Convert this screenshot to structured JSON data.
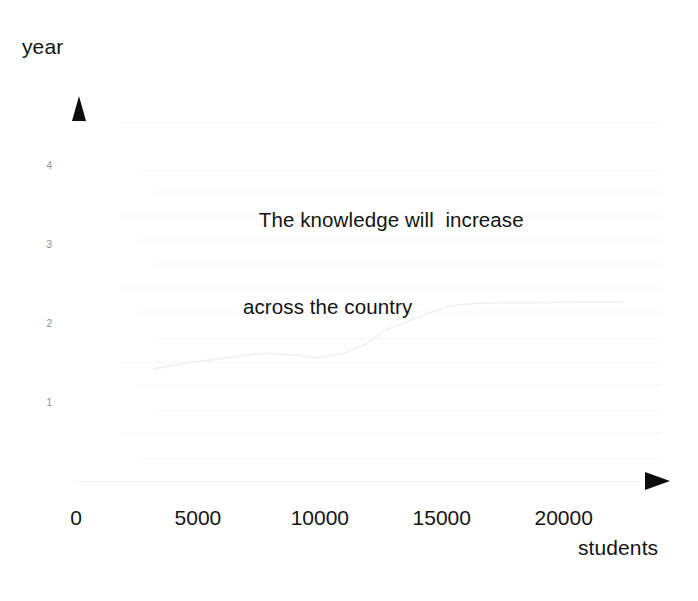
{
  "chart_data": {
    "type": "line",
    "title": "",
    "annotation": "The knowledge will  increase\nacross the country",
    "annotation_lines": [
      "The knowledge will  increase",
      "across the country"
    ],
    "xlabel": "students",
    "ylabel": "year",
    "x_tick_labels": [
      "0",
      "5000",
      "10000",
      "15000",
      "20000"
    ],
    "x_tick_values": [
      0,
      5000,
      10000,
      15000,
      20000
    ],
    "y_tick_labels": [
      "1",
      "2",
      "3",
      "4"
    ],
    "y_tick_values": [
      1,
      2,
      3,
      4
    ],
    "xlim": [
      0,
      23500
    ],
    "ylim": [
      0,
      4.6
    ],
    "grid": true,
    "grid_orientation": "horizontal",
    "legend": "none",
    "series": [
      {
        "name": "knowledge",
        "x": [
          3200,
          4600,
          6200,
          7600,
          8900,
          9900,
          11000,
          11900,
          12600,
          13600,
          14600,
          15400,
          16400,
          17600,
          19000,
          20600,
          22400
        ],
        "values": [
          1.42,
          1.5,
          1.56,
          1.62,
          1.6,
          1.56,
          1.62,
          1.74,
          1.9,
          2.02,
          2.14,
          2.22,
          2.25,
          2.26,
          2.26,
          2.27,
          2.27
        ]
      }
    ],
    "colors": {
      "axis": "#f2f2f4",
      "arrow": "#0d0d0d",
      "gridline": "#f4f4f6",
      "series": "#f0f0f3",
      "text": "#141414",
      "y_tick_text": "#8d8d92",
      "background": "#ffffff"
    },
    "faint_gridline_y_px": [
      122,
      170,
      192,
      216,
      240,
      264,
      288,
      312,
      338,
      362,
      385,
      410,
      433,
      458
    ],
    "note": "Faded / low-contrast scan of a hand-made line chart; plotted line and gridlines are near-white."
  }
}
